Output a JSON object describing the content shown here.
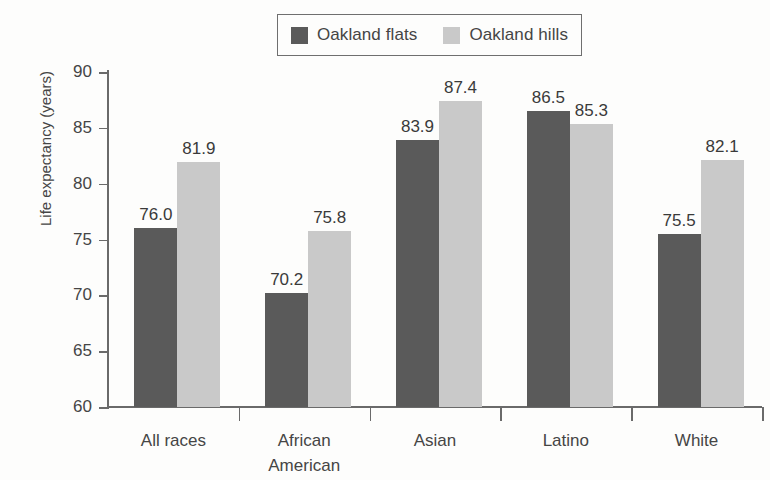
{
  "legend": {
    "entries": [
      {
        "label": "Oakland flats",
        "color": "#5a5a5a",
        "key": "flats"
      },
      {
        "label": "Oakland hills",
        "color": "#c9c9c9",
        "key": "hills"
      }
    ]
  },
  "axes": {
    "ylabel": "Life expectancy (years)",
    "yticks": [
      "60",
      "65",
      "70",
      "75",
      "80",
      "85",
      "90"
    ]
  },
  "chart_data": {
    "type": "bar",
    "title": "",
    "xlabel": "",
    "ylabel": "Life expectancy (years)",
    "ylim": [
      60,
      90
    ],
    "ytick_values": [
      60,
      65,
      70,
      75,
      80,
      85,
      90
    ],
    "grid": false,
    "legend_position": "top-center",
    "categories": [
      "All races",
      "African American",
      "Asian",
      "Latino",
      "White"
    ],
    "category_display": [
      [
        "All races"
      ],
      [
        "African",
        "American"
      ],
      [
        "Asian"
      ],
      [
        "Latino"
      ],
      [
        "White"
      ]
    ],
    "series": [
      {
        "name": "Oakland flats",
        "color": "#5a5a5a",
        "values": [
          76.0,
          70.2,
          83.9,
          86.5,
          75.5
        ],
        "labels": [
          "76.0",
          "70.2",
          "83.9",
          "86.5",
          "75.5"
        ]
      },
      {
        "name": "Oakland hills",
        "color": "#c9c9c9",
        "values": [
          81.9,
          75.8,
          87.4,
          85.3,
          82.1
        ],
        "labels": [
          "81.9",
          "75.8",
          "87.4",
          "85.3",
          "82.1"
        ]
      }
    ]
  }
}
